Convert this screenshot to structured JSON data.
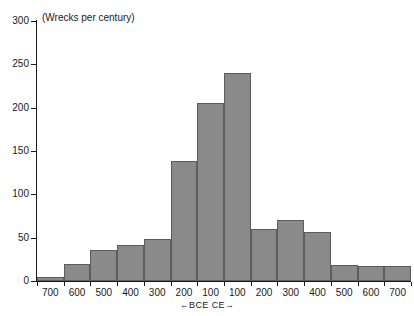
{
  "chart_data": {
    "type": "bar",
    "title": "(Wrecks per century)",
    "xlabel": "←BCE  CE→",
    "ylabel": "",
    "categories": [
      "700 BCE",
      "600 BCE",
      "500 BCE",
      "400 BCE",
      "300 BCE",
      "200 BCE",
      "100 BCE",
      "100 CE",
      "200 CE",
      "300 CE",
      "400 CE",
      "500 CE",
      "600 CE",
      "700 CE"
    ],
    "tick_labels": [
      "700",
      "600",
      "500",
      "400",
      "300",
      "200",
      "100",
      "100",
      "200",
      "300",
      "400",
      "500",
      "600",
      "700"
    ],
    "values": [
      5,
      20,
      36,
      42,
      48,
      138,
      205,
      240,
      60,
      70,
      56,
      19,
      17,
      17
    ],
    "ylim": [
      0,
      300
    ],
    "y_ticks": [
      0,
      50,
      100,
      150,
      200,
      250,
      300
    ],
    "y_tick_labels": [
      "0",
      "50",
      "100",
      "150",
      "200",
      "250",
      "300"
    ],
    "grid": false,
    "legend": false,
    "bar_color": "#8a8a8a",
    "bar_edge_color": "#5d5d5d",
    "axis_color": "#1a1a1a",
    "background": "#ffffff"
  }
}
